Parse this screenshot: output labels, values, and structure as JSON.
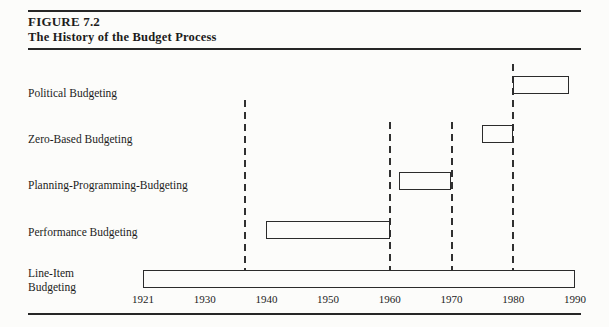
{
  "figure": {
    "label": "FIGURE 7.2",
    "title": "The History of the Budget Process"
  },
  "colors": {
    "ink": "#1c1c1c",
    "paper": "#fcfcfa",
    "bar_fill": "#fcfcfa",
    "bar_border": "#2b2b2b"
  },
  "chart_data": {
    "type": "bar",
    "variant": "horizontal-timeline-gantt",
    "title": "The History of the Budget Process",
    "xlabel": "",
    "ylabel": "",
    "grid": "off",
    "legend": "none",
    "x_axis": {
      "ticks": [
        "1921",
        "1930",
        "1940",
        "1950",
        "1960",
        "1970",
        "1980",
        "1990"
      ],
      "range": [
        1921,
        1990
      ]
    },
    "series": [
      {
        "label": "Political Budgeting",
        "label_lines": [
          "Political Budgeting"
        ],
        "start": 1980,
        "end": 1989
      },
      {
        "label": "Zero-Based Budgeting",
        "label_lines": [
          "Zero-Based Budgeting"
        ],
        "start": 1975,
        "end": 1980
      },
      {
        "label": "Planning-Programming-Budgeting",
        "label_lines": [
          "Planning-Programming-Budgeting"
        ],
        "start": 1961.5,
        "end": 1970
      },
      {
        "label": "Performance Budgeting",
        "label_lines": [
          "Performance Budgeting"
        ],
        "start": 1940,
        "end": 1960
      },
      {
        "label": "Line-Item Budgeting",
        "label_lines": [
          "Line-Item",
          "Budgeting"
        ],
        "start": 1921,
        "end": 1990
      }
    ],
    "reference_lines": [
      {
        "year": 1936.5
      },
      {
        "year": 1960
      },
      {
        "year": 1970
      },
      {
        "year": 1980
      }
    ]
  }
}
